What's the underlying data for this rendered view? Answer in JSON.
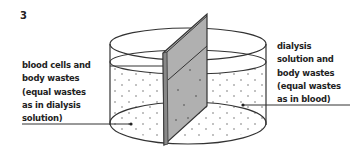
{
  "figure": {
    "number": "3",
    "left_label": {
      "lines": [
        "blood cells and",
        "body wastes",
        "(equal wastes",
        "as in dialysis",
        "solution)"
      ]
    },
    "right_label": {
      "lines": [
        "dialysis",
        "solution and",
        "body wastes",
        "(equal wastes",
        "as in blood)"
      ]
    }
  }
}
